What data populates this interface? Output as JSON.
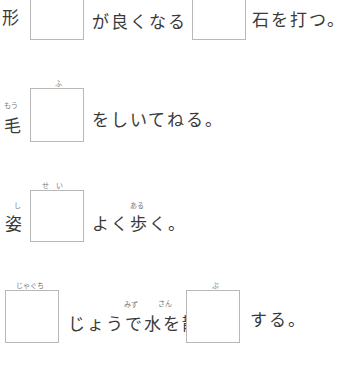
{
  "worksheet": {
    "rows": [
      {
        "prefix": "形",
        "prefix_ruby": "",
        "box1_ruby": "",
        "middle_text": "が良くなる",
        "box2_ruby": "",
        "suffix_text": "石を打つ。"
      },
      {
        "prefix": "毛",
        "prefix_ruby": "もう",
        "box1_ruby": "ふ",
        "middle_text": "をしいてねる。"
      },
      {
        "prefix": "姿",
        "prefix_ruby": "し",
        "box1_ruby": "せ　い",
        "middle_text": "よく歩く。",
        "middle_ruby": "ある"
      },
      {
        "box1_ruby": "じゃぐち",
        "middle_text": "じょうで水を散",
        "middle_ruby_1": "みず",
        "middle_ruby_2": "さん",
        "box2_ruby": "ぶ",
        "suffix_text": "する。"
      }
    ]
  }
}
